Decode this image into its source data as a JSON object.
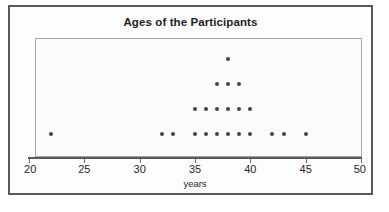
{
  "chart_data": {
    "type": "scatter",
    "plot_style": "dot-plot",
    "title": "Ages of the Participants",
    "xlabel": "years",
    "ylabel": "",
    "xlim": [
      20,
      50
    ],
    "ylim": [
      0,
      4
    ],
    "grid": false,
    "legend": null,
    "x_ticks": [
      20,
      25,
      30,
      35,
      40,
      45,
      50
    ],
    "x_tick_labels": [
      "20",
      "25",
      "30",
      "35",
      "40",
      "45",
      "50"
    ],
    "x_minor_step": 1,
    "categories": [
      22,
      32,
      33,
      35,
      36,
      37,
      38,
      39,
      40,
      42,
      43,
      45
    ],
    "values": [
      1,
      1,
      1,
      2,
      2,
      3,
      4,
      3,
      2,
      1,
      1,
      1
    ],
    "dot_color": "#444444",
    "frame_color": "#595959",
    "plot_border_color": "#a6a6a6",
    "plot_background": "#fbfbfb",
    "total_dots": 22,
    "points": [
      {
        "x": 22,
        "stack": 1
      },
      {
        "x": 32,
        "stack": 1
      },
      {
        "x": 33,
        "stack": 1
      },
      {
        "x": 35,
        "stack": 1
      },
      {
        "x": 35,
        "stack": 2
      },
      {
        "x": 36,
        "stack": 1
      },
      {
        "x": 36,
        "stack": 2
      },
      {
        "x": 37,
        "stack": 1
      },
      {
        "x": 37,
        "stack": 2
      },
      {
        "x": 37,
        "stack": 3
      },
      {
        "x": 38,
        "stack": 1
      },
      {
        "x": 38,
        "stack": 2
      },
      {
        "x": 38,
        "stack": 3
      },
      {
        "x": 38,
        "stack": 4
      },
      {
        "x": 39,
        "stack": 1
      },
      {
        "x": 39,
        "stack": 2
      },
      {
        "x": 39,
        "stack": 3
      },
      {
        "x": 40,
        "stack": 1
      },
      {
        "x": 40,
        "stack": 2
      },
      {
        "x": 42,
        "stack": 1
      },
      {
        "x": 43,
        "stack": 1
      },
      {
        "x": 45,
        "stack": 1
      }
    ]
  },
  "figure": {
    "title": "Ages of the Participants",
    "axis_title": "years"
  }
}
